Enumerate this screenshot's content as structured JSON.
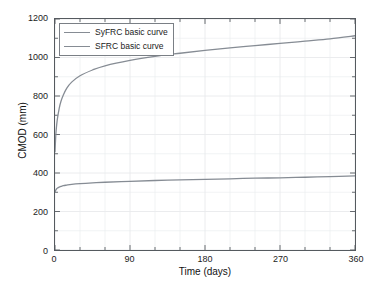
{
  "chart_data": {
    "type": "line",
    "title": "",
    "xlabel": "Time (days)",
    "ylabel": "CMOD (mm)",
    "xlim": [
      0,
      360
    ],
    "ylim": [
      0,
      1200
    ],
    "xticks": [
      "0",
      "90",
      "180",
      "270",
      "360"
    ],
    "yticks": [
      "0",
      "200",
      "400",
      "600",
      "800",
      "1000",
      "1200"
    ],
    "xtick_values": [
      0,
      90,
      180,
      270,
      360
    ],
    "ytick_values": [
      0,
      200,
      400,
      600,
      800,
      1000,
      1200
    ],
    "x_minor_step": 30,
    "y_minor_step": 100,
    "grid": true,
    "legend_position": "upper-left",
    "line_color": "#868c94",
    "grid_color": "#e8eaec",
    "axis_color": "#555a5f",
    "background": "#ffffff",
    "x": [
      0,
      1,
      2,
      3,
      5,
      7,
      10,
      14,
      20,
      30,
      45,
      60,
      90,
      120,
      150,
      180,
      210,
      240,
      270,
      300,
      330,
      360
    ],
    "series": [
      {
        "name": "SyFRC basic curve",
        "values": [
          510,
          600,
          650,
          685,
          735,
          770,
          805,
          840,
          872,
          905,
          935,
          957,
          985,
          1006,
          1022,
          1037,
          1050,
          1062,
          1073,
          1085,
          1097,
          1113
        ]
      },
      {
        "name": "SFRC basic curve",
        "values": [
          300,
          312,
          318,
          322,
          327,
          330,
          334,
          337,
          341,
          345,
          349,
          352,
          357,
          361,
          364,
          367,
          370,
          373,
          375,
          378,
          381,
          385
        ]
      }
    ],
    "legend": [
      "SyFRC basic curve",
      "SFRC basic curve"
    ]
  }
}
